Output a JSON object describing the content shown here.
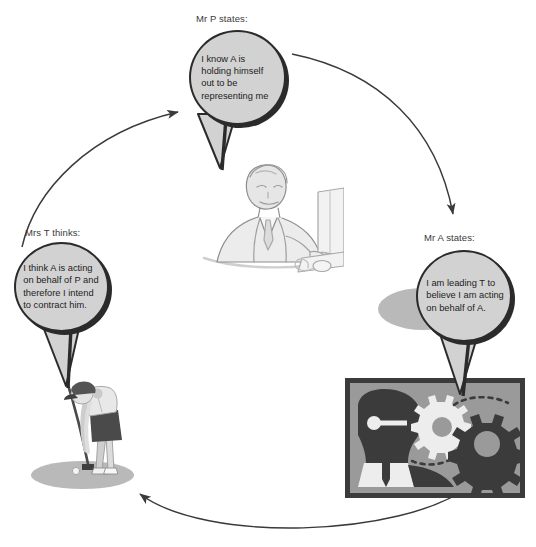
{
  "diagram": {
    "type": "cycle-diagram",
    "background": "#ffffff",
    "palette": {
      "bubble_fill": "#d2d2d2",
      "bubble_stroke": "#2b2b2b",
      "arrow": "#3a3a3a",
      "caption_text": "#3a3a3a",
      "bubble_text": "#1d1d1d",
      "gearbox_border": "#3b3b3b",
      "gearbox_bg": "#9a9a9a",
      "gear_dark": "#3b3b3b",
      "gear_light": "#ededed",
      "shadow": "#b9b9b9"
    },
    "nodes": [
      {
        "id": "principal",
        "caption": "Mr P states:",
        "quote": "I know A is holding himself out to be representing me",
        "figure": "businessman-at-computer",
        "position": "top"
      },
      {
        "id": "agent",
        "caption": "Mr A states:",
        "quote": "I am leading T to believe I am acting on behalf of A.",
        "figure": "head-with-gears",
        "position": "right"
      },
      {
        "id": "third-party",
        "caption": "Mrs T thinks:",
        "quote": "I think A is acting on behalf of P and therefore I intend to contract him.",
        "figure": "woman-golfer",
        "position": "left"
      }
    ],
    "arrows": [
      {
        "id": "t-to-p",
        "from": "third-party",
        "to": "principal",
        "direction": "clockwise"
      },
      {
        "id": "p-to-a",
        "from": "principal",
        "to": "agent",
        "direction": "clockwise"
      },
      {
        "id": "a-to-t",
        "from": "agent",
        "to": "third-party",
        "direction": "clockwise"
      }
    ]
  }
}
